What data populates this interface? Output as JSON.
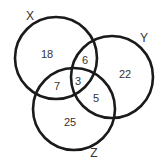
{
  "sets": [
    {
      "id": "X",
      "label": "X"
    },
    {
      "id": "Y",
      "label": "Y"
    },
    {
      "id": "Z",
      "label": "Z"
    }
  ],
  "regions": {
    "x_only": "18",
    "y_only": "22",
    "z_only": "25",
    "x_y": "6",
    "x_z": "7",
    "y_z": "5",
    "x_y_z": "3"
  },
  "colors": {
    "stroke": "#1a1a1a",
    "text": "#333333",
    "background": "#ffffff"
  }
}
